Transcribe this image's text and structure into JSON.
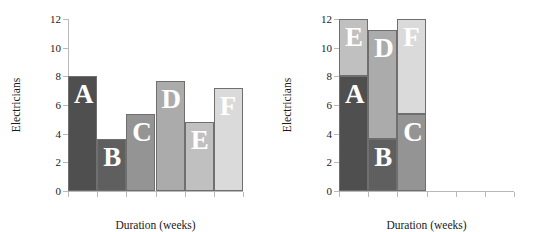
{
  "chart_data": [
    {
      "id": "left",
      "type": "bar",
      "title": "",
      "xlabel": "Duration (weeks)",
      "ylabel": "Electricians",
      "categories": [
        "A",
        "B",
        "C",
        "D",
        "E",
        "F"
      ],
      "values": [
        8,
        3.6,
        5.4,
        7.7,
        4.8,
        7.2
      ],
      "ylim": [
        0,
        12
      ],
      "yticks": [
        0,
        2,
        4,
        6,
        8,
        10,
        12
      ],
      "yticklabels": [
        "0",
        "2",
        "4",
        "6",
        "8",
        "10",
        "12"
      ],
      "xlim": [
        0,
        6
      ],
      "xticks": [
        0,
        1,
        2,
        3,
        4,
        5,
        6
      ],
      "xticklabels": [
        "",
        "",
        "",
        "",
        "",
        "",
        ""
      ],
      "grid": false,
      "legend": false,
      "bars": [
        {
          "label": "A",
          "x0": 0,
          "x1": 1,
          "y0": 0,
          "y1": 8,
          "color": "#4f4f4f"
        },
        {
          "label": "B",
          "x0": 1,
          "x1": 2,
          "y0": 0,
          "y1": 3.6,
          "color": "#5f5f5f"
        },
        {
          "label": "C",
          "x0": 2,
          "x1": 3,
          "y0": 0,
          "y1": 5.4,
          "color": "#949494"
        },
        {
          "label": "D",
          "x0": 3,
          "x1": 4,
          "y0": 0,
          "y1": 7.7,
          "color": "#ababab"
        },
        {
          "label": "E",
          "x0": 4,
          "x1": 5,
          "y0": 0,
          "y1": 4.8,
          "color": "#c0c0c0"
        },
        {
          "label": "F",
          "x0": 5,
          "x1": 6,
          "y0": 0,
          "y1": 7.2,
          "color": "#dadada"
        }
      ]
    },
    {
      "id": "right",
      "type": "bar",
      "title": "",
      "xlabel": "Duration (weeks)",
      "ylabel": "Electricians",
      "categories": [
        "A",
        "B",
        "C",
        "D",
        "E",
        "F"
      ],
      "values": [
        8,
        3.6,
        5.4,
        7.6,
        4.0,
        6.6
      ],
      "ylim": [
        0,
        12
      ],
      "yticks": [
        0,
        2,
        4,
        6,
        8,
        10,
        12
      ],
      "yticklabels": [
        "0",
        "2",
        "4",
        "6",
        "8",
        "10",
        "12"
      ],
      "xlim": [
        0,
        6
      ],
      "xticks": [
        0,
        1,
        2,
        3,
        4,
        5,
        6
      ],
      "xticklabels": [
        "",
        "",
        "",
        "",
        "",
        "",
        ""
      ],
      "grid": false,
      "legend": false,
      "stacked": true,
      "bars": [
        {
          "label": "A",
          "x0": 0,
          "x1": 1,
          "y0": 0,
          "y1": 8,
          "color": "#4f4f4f"
        },
        {
          "label": "E",
          "x0": 0,
          "x1": 1,
          "y0": 8,
          "y1": 12,
          "color": "#c0c0c0"
        },
        {
          "label": "B",
          "x0": 1,
          "x1": 2,
          "y0": 0,
          "y1": 3.6,
          "color": "#5f5f5f"
        },
        {
          "label": "D",
          "x0": 1,
          "x1": 2,
          "y0": 3.6,
          "y1": 11.2,
          "color": "#ababab"
        },
        {
          "label": "C",
          "x0": 2,
          "x1": 3,
          "y0": 0,
          "y1": 5.4,
          "color": "#949494"
        },
        {
          "label": "F",
          "x0": 2,
          "x1": 3,
          "y0": 5.4,
          "y1": 12,
          "color": "#dadada"
        }
      ]
    }
  ],
  "axis_color": "#b9b9b9",
  "bar_edge_color": "#6f6f6f",
  "label_text_color": "#ffffff"
}
